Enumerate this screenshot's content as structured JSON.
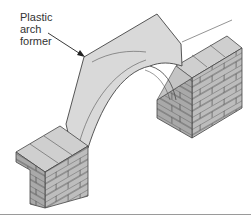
{
  "figure": {
    "annotation": {
      "lines": [
        "Plastic",
        "arch",
        "former"
      ]
    },
    "colors": {
      "former_fill": "#d9d9d9",
      "brick_face": "#bdbdbd",
      "brick_top": "#cfcfcf",
      "brick_side": "#a9a9a9",
      "outline": "#444444",
      "rule": "#9a9a9a"
    }
  }
}
